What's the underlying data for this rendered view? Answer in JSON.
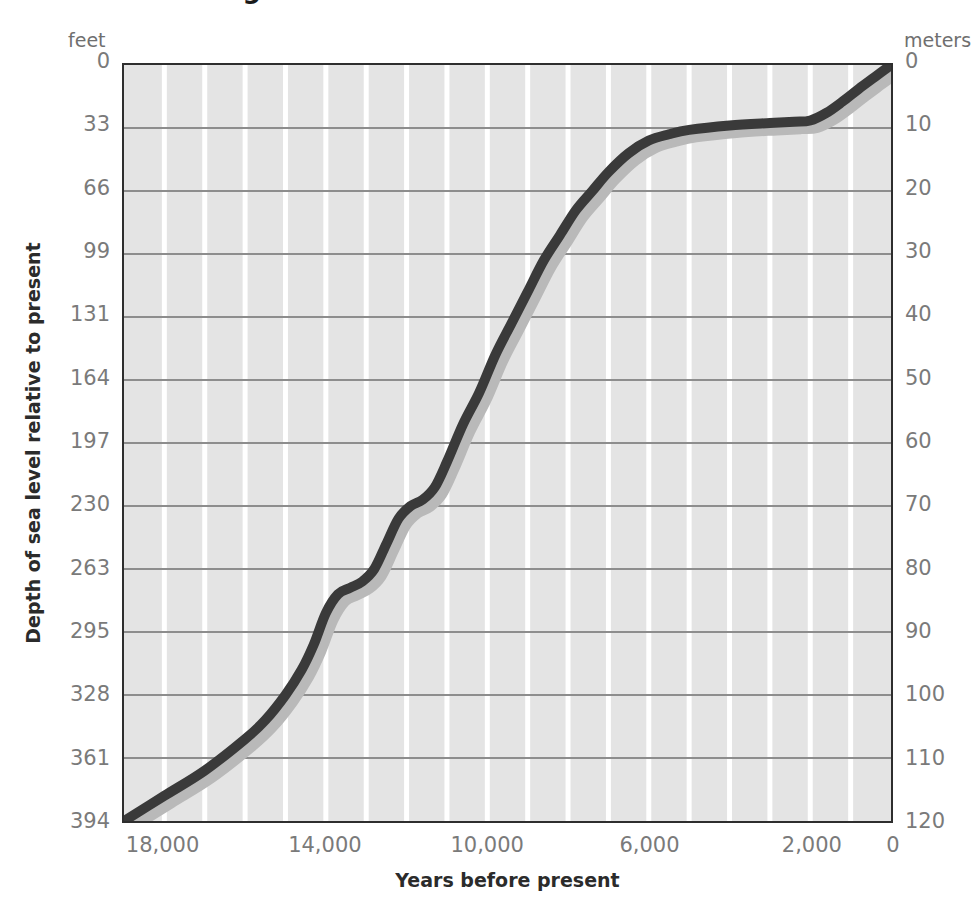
{
  "title": "Sea Level Rising",
  "axes": {
    "left_unit": "feet",
    "right_unit": "meters",
    "y_label": "Depth of sea level relative to present",
    "x_label": "Years before present"
  },
  "chart_data": {
    "type": "line",
    "title": "Sea Level Rising",
    "xlabel": "Years before present",
    "ylabel": "Depth of sea level relative to present",
    "xlim": [
      19000,
      0
    ],
    "x_axis_reversed": true,
    "ylim": [
      120,
      0
    ],
    "y_axis_inverted": true,
    "grid": true,
    "legend": null,
    "x_ticks": [
      18000,
      14000,
      10000,
      6000,
      2000,
      0
    ],
    "x_tick_labels": [
      "18,000",
      "14,000",
      "10,000",
      "6,000",
      "2,000",
      "0"
    ],
    "x_minor_gridline_step": 1000,
    "y_left_unit": "feet",
    "y_left_ticks": [
      0,
      33,
      66,
      99,
      131,
      164,
      197,
      230,
      263,
      295,
      328,
      361,
      394
    ],
    "y_left_tick_labels": [
      "0",
      "33",
      "66",
      "99",
      "131",
      "164",
      "197",
      "230",
      "263",
      "295",
      "328",
      "361",
      "394"
    ],
    "y_right_unit": "meters",
    "y_right_ticks": [
      0,
      10,
      20,
      30,
      40,
      50,
      60,
      70,
      80,
      90,
      100,
      110,
      120
    ],
    "y_right_tick_labels": [
      "0",
      "10",
      "20",
      "30",
      "40",
      "50",
      "60",
      "70",
      "80",
      "90",
      "100",
      "110",
      "120"
    ],
    "series": [
      {
        "name": "Sea level depth below present",
        "units": "meters below present sea level",
        "x": [
          19000,
          18000,
          17000,
          16000,
          15500,
          15000,
          14600,
          14300,
          14000,
          13700,
          13400,
          13100,
          12800,
          12500,
          12200,
          11900,
          11600,
          11300,
          11000,
          10600,
          10200,
          9800,
          9400,
          9000,
          8600,
          8200,
          7800,
          7400,
          7000,
          6500,
          6000,
          5500,
          5000,
          4000,
          3000,
          2400,
          2000,
          1600,
          1200,
          800,
          400,
          0
        ],
        "values": [
          120,
          116,
          112,
          107,
          104,
          100,
          96,
          92,
          87,
          84,
          83,
          82,
          80,
          76,
          72,
          70,
          69,
          67,
          63,
          57,
          52,
          46,
          41,
          36,
          31,
          27,
          23,
          20,
          17,
          14,
          12,
          11,
          10.3,
          9.6,
          9.2,
          9.0,
          8.8,
          7.6,
          5.8,
          3.8,
          1.9,
          0
        ]
      }
    ],
    "colors": {
      "line": "#3a3a3a",
      "line_shadow": "#b9b9b9",
      "plot_background": "#e4e4e4",
      "major_gridline": "#8d8d8d",
      "minor_gridline": "#ffffff",
      "frame": "#2e2e2e",
      "tick_text": "#7a7a7a",
      "axis_title_text": "#2b2b2b"
    }
  }
}
